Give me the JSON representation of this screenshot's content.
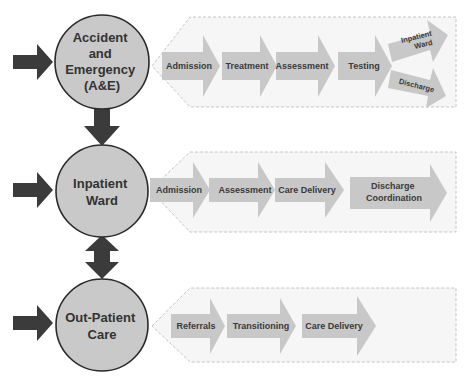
{
  "diagram": {
    "colors": {
      "node_fill": "#c9c9c9",
      "node_stroke": "#2a2a2a",
      "step_fill": "#c8c8c8",
      "panel_fill": "#f6f6f6",
      "arrow_dark": "#3b3b3b",
      "text": "#333333"
    },
    "nodes": [
      {
        "id": "ae",
        "label_lines": [
          "Accident",
          "and",
          "Emergency",
          "(A&E)"
        ],
        "steps": [
          "Admission",
          "Treatment",
          "Assessment",
          "Testing"
        ],
        "branches": [
          {
            "label_lines": [
              "Inpatient",
              "Ward"
            ]
          },
          {
            "label_lines": [
              "Discharge"
            ]
          }
        ]
      },
      {
        "id": "inpatient",
        "label_lines": [
          "Inpatient",
          "Ward"
        ],
        "steps": [
          "Admission",
          "Assessment",
          "Care Delivery"
        ],
        "final_step_lines": [
          "Discharge",
          "Coordination"
        ]
      },
      {
        "id": "outpatient",
        "label_lines": [
          "Out-Patient",
          "Care"
        ],
        "steps": [
          "Referrals",
          "Transitioning",
          "Care Delivery"
        ]
      }
    ],
    "connectors": [
      {
        "from": "ae",
        "to": "inpatient",
        "type": "one-way-down"
      },
      {
        "from": "inpatient",
        "to": "outpatient",
        "type": "two-way"
      }
    ],
    "icons": {
      "entry_arrow": "right-arrow-icon",
      "step_arrow": "chevron-arrow-icon"
    }
  }
}
